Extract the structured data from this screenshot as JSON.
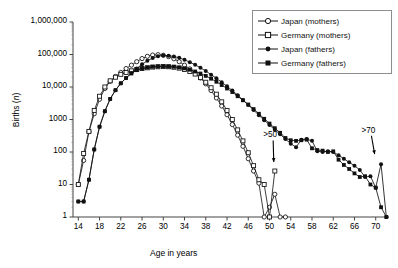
{
  "chart_data": {
    "type": "line",
    "title": "",
    "xlabel": "Age in years",
    "ylabel": "Births (n)",
    "yscale": "log",
    "ylim": [
      1,
      1000000
    ],
    "xlim": [
      13,
      72.5
    ],
    "grid": false,
    "legend_position": "top-right",
    "ytick_labels": [
      "1,000,000",
      "100,000",
      "10,000",
      "1000",
      "100",
      "10",
      "1"
    ],
    "ytick_values": [
      1000000,
      100000,
      10000,
      1000,
      100,
      10,
      1
    ],
    "xtick_labels": [
      "14",
      "18",
      "22",
      "26",
      "30",
      "34",
      "38",
      "42",
      "46",
      "50",
      "54",
      "58",
      "62",
      "66",
      "70"
    ],
    "xtick_values": [
      14,
      18,
      22,
      26,
      30,
      34,
      38,
      42,
      46,
      50,
      54,
      58,
      62,
      66,
      70
    ],
    "annotations": [
      {
        "text": ">50",
        "x": 50.5,
        "y": 300,
        "arrow_to_x": 50.8,
        "arrow_to_y": 40
      },
      {
        "text": ">70",
        "x": 69.0,
        "y": 420,
        "arrow_to_x": 69.8,
        "arrow_to_y": 70
      }
    ],
    "series": [
      {
        "name": "Japan (mothers)",
        "marker": "open-circle",
        "color": "#1a1a1a",
        "x": [
          14,
          15,
          16,
          17,
          18,
          19,
          20,
          21,
          22,
          23,
          24,
          25,
          26,
          27,
          28,
          29,
          30,
          31,
          32,
          33,
          34,
          35,
          36,
          37,
          38,
          39,
          40,
          41,
          42,
          43,
          44,
          45,
          46,
          47,
          48,
          49,
          50,
          51,
          52,
          53
        ],
        "y": [
          10,
          55,
          420,
          1500,
          4200,
          9000,
          15000,
          21000,
          28000,
          37000,
          47000,
          60000,
          75000,
          88000,
          96000,
          99000,
          95000,
          86000,
          74000,
          60000,
          47000,
          36000,
          27000,
          19000,
          12500,
          7800,
          4600,
          2600,
          1400,
          700,
          330,
          150,
          62,
          26,
          11,
          1,
          2,
          5,
          1,
          1
        ]
      },
      {
        "name": "Germany (mothers)",
        "marker": "open-square",
        "color": "#1a1a1a",
        "x": [
          14,
          15,
          16,
          17,
          18,
          19,
          20,
          21,
          22,
          23,
          24,
          25,
          26,
          27,
          28,
          29,
          30,
          31,
          32,
          33,
          34,
          35,
          36,
          37,
          38,
          39,
          40,
          41,
          42,
          43,
          44,
          45,
          46,
          47,
          48,
          49,
          50,
          51
        ],
        "y": [
          10,
          90,
          430,
          1900,
          5200,
          10000,
          15500,
          20000,
          24500,
          28000,
          31500,
          34500,
          37000,
          39000,
          41000,
          42000,
          42500,
          42000,
          40500,
          38000,
          34500,
          30000,
          25000,
          19500,
          14000,
          9500,
          6000,
          3500,
          1900,
          1000,
          480,
          220,
          95,
          38,
          14,
          10,
          1,
          26
        ]
      },
      {
        "name": "Japan (fathers)",
        "marker": "filled-circle",
        "color": "#111111",
        "x": [
          14,
          15,
          16,
          17,
          18,
          19,
          20,
          21,
          22,
          23,
          24,
          25,
          26,
          27,
          28,
          29,
          30,
          31,
          32,
          33,
          34,
          35,
          36,
          37,
          38,
          39,
          40,
          41,
          42,
          43,
          44,
          45,
          46,
          47,
          48,
          49,
          50,
          51,
          52,
          53,
          54,
          55,
          56,
          57,
          58,
          59,
          60,
          61,
          62,
          63,
          64,
          65,
          66,
          67,
          68,
          69,
          70,
          71,
          72
        ],
        "y": [
          3,
          3,
          14,
          120,
          600,
          1800,
          4300,
          8000,
          13000,
          19000,
          27000,
          37000,
          50000,
          64000,
          78000,
          88000,
          93000,
          92000,
          87000,
          79000,
          69000,
          58000,
          48000,
          39000,
          31000,
          24000,
          18500,
          14000,
          10500,
          7800,
          5600,
          4000,
          2800,
          1950,
          1350,
          950,
          680,
          480,
          350,
          250,
          180,
          140,
          240,
          250,
          220,
          105,
          100,
          105,
          100,
          80,
          62,
          48,
          38,
          28,
          17,
          18,
          8,
          42,
          1
        ]
      },
      {
        "name": "Germany (fathers)",
        "marker": "filled-square",
        "color": "#111111",
        "x": [
          14,
          15,
          16,
          17,
          18,
          19,
          20,
          21,
          22,
          23,
          24,
          25,
          26,
          27,
          28,
          29,
          30,
          31,
          32,
          33,
          34,
          35,
          36,
          37,
          38,
          39,
          40,
          41,
          42,
          43,
          44,
          45,
          46,
          47,
          48,
          49,
          50,
          51,
          52,
          53,
          54,
          55,
          56,
          57,
          58,
          59,
          60,
          61,
          62,
          63,
          64,
          65,
          66,
          67,
          68,
          69,
          70,
          71,
          72
        ],
        "y": [
          3,
          3,
          14,
          120,
          600,
          1800,
          4300,
          8000,
          13000,
          19000,
          26000,
          33000,
          37000,
          40000,
          42000,
          43000,
          43500,
          43000,
          42000,
          40000,
          37500,
          34000,
          30000,
          26000,
          22000,
          18000,
          14500,
          11500,
          9000,
          7000,
          5200,
          3900,
          2900,
          2100,
          1500,
          1050,
          750,
          540,
          390,
          270,
          230,
          220,
          230,
          240,
          130,
          115,
          110,
          100,
          105,
          58,
          40,
          30,
          22,
          17,
          18,
          10,
          8,
          2,
          1
        ]
      }
    ]
  },
  "legend": {
    "items": [
      {
        "label": "Japan (mothers)",
        "marker": "open-circle"
      },
      {
        "label": "Germany (mothers)",
        "marker": "open-square"
      },
      {
        "label": "Japan (fathers)",
        "marker": "filled-circle"
      },
      {
        "label": "Germany (fathers)",
        "marker": "filled-square"
      }
    ]
  },
  "axes": {
    "x_title": "Age in years",
    "y_title_prefix": "Births (",
    "y_title_italic": "n",
    "y_title_suffix": ")"
  }
}
